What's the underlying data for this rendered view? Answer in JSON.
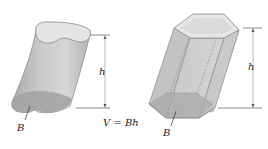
{
  "figure": {
    "left_solid": {
      "type": "oblique cylinder",
      "height_label": "h",
      "base_label": "B"
    },
    "right_solid": {
      "type": "oblique hexagonal prism",
      "height_label": "h",
      "base_label": "B"
    },
    "formula": "V = Bh"
  },
  "colors": {
    "body_fill": "#bdbdbd",
    "top_fill": "#e2e2e2",
    "base_fill": "#9e9e9e",
    "edge": "#8a8a8a",
    "dimension_line": "#555555"
  }
}
